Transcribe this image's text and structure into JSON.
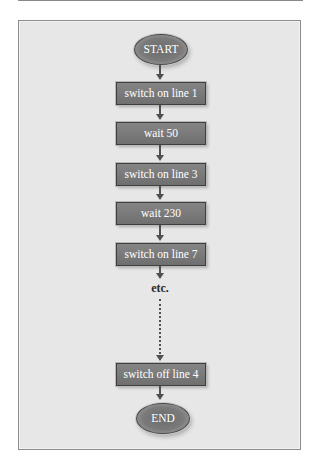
{
  "flowchart": {
    "start_label": "START",
    "end_label": "END",
    "steps": [
      {
        "label": "switch on line 1"
      },
      {
        "label": "wait 50"
      },
      {
        "label": "switch on line 3"
      },
      {
        "label": "wait 230"
      },
      {
        "label": "switch on line 7"
      },
      {
        "label": "switch off line 4"
      }
    ],
    "continuation_label": "etc."
  },
  "colors": {
    "panel_background": "#e7e7e7",
    "panel_border": "#8c8c8c",
    "node_fill": "#7a7a7a",
    "node_text": "#ffffff",
    "connector": "#505050"
  }
}
